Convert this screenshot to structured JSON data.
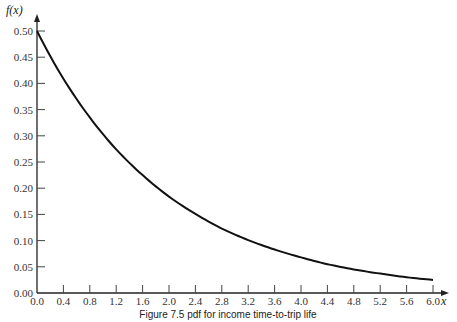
{
  "chart_data": {
    "type": "line",
    "title": "",
    "caption": "Figure 7.5 pdf for income time-to-trip life",
    "xlabel": "x",
    "ylabel": "f(x)",
    "xlim": [
      0.0,
      6.0
    ],
    "ylim": [
      0.0,
      0.5
    ],
    "grid": false,
    "legend": null,
    "x_ticks": [
      "0.0",
      "0.4",
      "0.8",
      "1.2",
      "1.6",
      "2.0",
      "2.4",
      "2.8",
      "3.2",
      "3.6",
      "4.0",
      "4.4",
      "4.8",
      "5.2",
      "5.6",
      "6.0"
    ],
    "y_ticks": [
      "0.00",
      "0.05",
      "0.10",
      "0.15",
      "0.20",
      "0.25",
      "0.30",
      "0.35",
      "0.40",
      "0.45",
      "0.50"
    ],
    "series": [
      {
        "name": "f(x) = 0.5 e^(-x/2)",
        "x": [
          0.0,
          0.4,
          0.8,
          1.2,
          1.6,
          2.0,
          2.4,
          2.8,
          3.2,
          3.6,
          4.0,
          4.4,
          4.8,
          5.2,
          5.6,
          6.0
        ],
        "values": [
          0.5,
          0.409,
          0.335,
          0.274,
          0.225,
          0.184,
          0.151,
          0.123,
          0.101,
          0.083,
          0.068,
          0.055,
          0.045,
          0.037,
          0.03,
          0.025
        ]
      }
    ]
  }
}
